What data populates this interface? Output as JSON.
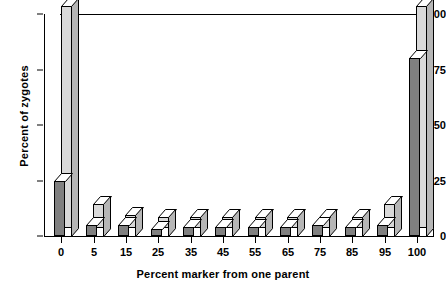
{
  "chart_data": {
    "type": "bar",
    "title": "",
    "xlabel": "Percent marker from one parent",
    "ylabel": "Percent of zygotes",
    "categories": [
      "0",
      "5",
      "15",
      "25",
      "35",
      "45",
      "55",
      "65",
      "75",
      "85",
      "95",
      "100"
    ],
    "xtick_labels": [
      "0",
      "5",
      "15",
      "25",
      "35",
      "45",
      "55",
      "65",
      "75",
      "85",
      "95",
      "100"
    ],
    "ytick_labels": [
      "0",
      "25",
      "50",
      "75",
      "100"
    ],
    "ytick_values": [
      0,
      25,
      50,
      75,
      100
    ],
    "ylim": [
      0,
      100
    ],
    "grid": false,
    "legend": false,
    "series": [
      {
        "name": "front-bar",
        "color": "#808080",
        "values": [
          25,
          5,
          5,
          3,
          4,
          4,
          4,
          4,
          5,
          4,
          5,
          80
        ]
      },
      {
        "name": "back-bar",
        "color": "#d9d9d9",
        "values": [
          100,
          11,
          6,
          5,
          5,
          5,
          5,
          5,
          5,
          5,
          11,
          100
        ]
      }
    ],
    "annotations": [
      "Bimodal distribution: nearly all zygotes at 0% or 100% marker",
      "Middle categories near 5%"
    ]
  },
  "colors": {
    "front_fill": "#808080",
    "back_fill": "#d9d9d9",
    "side_fill": "#b6b6b6",
    "top_fill": "#ffffff",
    "outline": "#000000",
    "background": "#ffffff"
  }
}
